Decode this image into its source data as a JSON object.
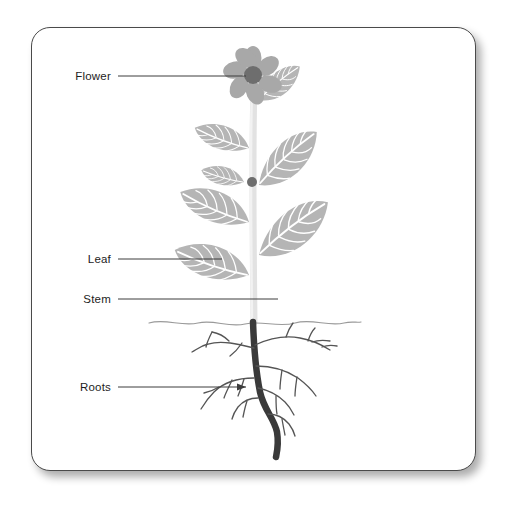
{
  "diagram": {
    "type": "botanical-labelled-illustration",
    "background_color": "#ffffff",
    "card": {
      "background_color": "#ffffff",
      "border_color": "#4a4a4a",
      "corner_radius_px": 19,
      "shadow": "soft drop shadow bottom-right"
    },
    "labels": [
      {
        "id": "flower",
        "text": "Flower",
        "leader_line": true,
        "arrowhead": false,
        "target": "flower head at top of stem"
      },
      {
        "id": "leaf",
        "text": "Leaf",
        "leader_line": true,
        "arrowhead": false,
        "target": "lower left leaf"
      },
      {
        "id": "stem",
        "text": "Stem",
        "leader_line": true,
        "arrowhead": false,
        "target": "main vertical stem"
      },
      {
        "id": "roots",
        "text": "Roots",
        "leader_line": true,
        "arrowhead": true,
        "target": "lateral root branch"
      }
    ],
    "parts": {
      "flower": {
        "petal_count": 7,
        "petal_color": "#a8a8a8",
        "center_color": "#6e6e6e"
      },
      "leaves": {
        "count": 9,
        "fill_color": "#b5b5b5",
        "vein_color": "#ffffff",
        "arrangement": "alternate"
      },
      "stem": {
        "color": "#e2e2e2",
        "above_ground": true
      },
      "bud": {
        "color": "#6e6e6e",
        "shape": "small dot"
      },
      "soil_line": {
        "color": "#9a9a9a",
        "style": "wavy horizontal"
      },
      "roots": {
        "taproot_color": "#3a3a3a",
        "lateral_color": "#555555",
        "lateral_count": 8
      }
    }
  }
}
